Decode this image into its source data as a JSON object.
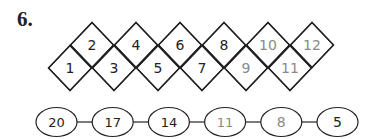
{
  "problem": {
    "number": "6."
  },
  "diamond_pattern": {
    "cells": [
      {
        "value": "1",
        "row": "bottom",
        "color": "#222222"
      },
      {
        "value": "2",
        "row": "top",
        "color": "#222222"
      },
      {
        "value": "3",
        "row": "bottom",
        "color": "#222222"
      },
      {
        "value": "4",
        "row": "top",
        "color": "#222222"
      },
      {
        "value": "5",
        "row": "bottom",
        "color": "#222222"
      },
      {
        "value": "6",
        "row": "top",
        "color": "#222222"
      },
      {
        "value": "7",
        "row": "bottom",
        "color": "#222222"
      },
      {
        "value": "8",
        "row": "top",
        "color": "#222222"
      },
      {
        "value": "9",
        "row": "bottom",
        "color": "#8a8a8a"
      },
      {
        "value": "10",
        "row": "top",
        "color": "#8a8a8a"
      },
      {
        "value": "11",
        "row": "bottom",
        "color": "#8a8a8a"
      },
      {
        "value": "12",
        "row": "top",
        "color": "#8a8a8a"
      }
    ]
  },
  "oval_chain": {
    "cells": [
      {
        "value": "20",
        "color": "#222222"
      },
      {
        "value": "17",
        "color": "#222222"
      },
      {
        "value": "14",
        "color": "#222222"
      },
      {
        "value": "11",
        "color": "#8a8a8a"
      },
      {
        "value": "8",
        "color": "#8a8a8a"
      },
      {
        "value": "5",
        "color": "#222222"
      }
    ]
  }
}
